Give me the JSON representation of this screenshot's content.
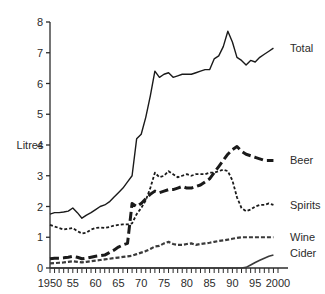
{
  "chart_data": {
    "type": "line",
    "title": "",
    "subtitle": "",
    "xlabel": "",
    "ylabel": "Litres",
    "xlim": [
      1950,
      2000
    ],
    "ylim": [
      0,
      8
    ],
    "ytick_step": 1,
    "xtick_step": 1,
    "xtick_label_step": 5,
    "grid": false,
    "legend_position": "right-inline-labels",
    "yticks": [
      0,
      1,
      2,
      3,
      4,
      5,
      6,
      7,
      8
    ],
    "ytick_labels": [
      "0",
      "1",
      "2",
      "3",
      "4",
      "5",
      "6",
      "7",
      "8"
    ],
    "xticks": [
      1950,
      1955,
      1960,
      1965,
      1970,
      1975,
      1980,
      1985,
      1990,
      1995,
      2000
    ],
    "xtick_labels": [
      "1950",
      "55",
      "60",
      "65",
      "70",
      "75",
      "80",
      "85",
      "90",
      "95",
      "2000"
    ],
    "x": [
      1950,
      1951,
      1952,
      1953,
      1954,
      1955,
      1956,
      1957,
      1958,
      1959,
      1960,
      1961,
      1962,
      1963,
      1964,
      1965,
      1966,
      1967,
      1968,
      1969,
      1970,
      1971,
      1972,
      1973,
      1974,
      1975,
      1976,
      1977,
      1978,
      1979,
      1980,
      1981,
      1982,
      1983,
      1984,
      1985,
      1986,
      1987,
      1988,
      1989,
      1990,
      1991,
      1992,
      1993,
      1994,
      1995,
      1996,
      1997,
      1998,
      1999
    ],
    "series": [
      {
        "name": "Total",
        "label": "Total",
        "style": "solid",
        "color": "#1a1a1a",
        "width": 1.4,
        "values": [
          1.75,
          1.8,
          1.8,
          1.82,
          1.85,
          1.95,
          1.8,
          1.62,
          1.72,
          1.8,
          1.9,
          2.0,
          2.05,
          2.15,
          2.3,
          2.45,
          2.6,
          2.8,
          3.0,
          4.2,
          4.35,
          4.9,
          5.6,
          6.4,
          6.2,
          6.3,
          6.35,
          6.2,
          6.25,
          6.3,
          6.3,
          6.3,
          6.35,
          6.4,
          6.45,
          6.45,
          6.8,
          6.9,
          7.2,
          7.7,
          7.35,
          6.85,
          6.75,
          6.6,
          6.75,
          6.7,
          6.85,
          6.95,
          7.05,
          7.15
        ]
      },
      {
        "name": "Beer",
        "label": "Beer",
        "style": "long-dash",
        "color": "#1a1a1a",
        "width": 3.0,
        "values": [
          0.3,
          0.32,
          0.32,
          0.33,
          0.35,
          0.38,
          0.35,
          0.3,
          0.32,
          0.35,
          0.38,
          0.4,
          0.42,
          0.5,
          0.58,
          0.68,
          0.75,
          0.8,
          2.1,
          2.0,
          2.1,
          2.25,
          2.4,
          2.5,
          2.45,
          2.5,
          2.55,
          2.55,
          2.6,
          2.65,
          2.6,
          2.6,
          2.65,
          2.7,
          2.8,
          2.9,
          3.1,
          3.3,
          3.5,
          3.7,
          3.85,
          3.95,
          3.8,
          3.7,
          3.65,
          3.6,
          3.55,
          3.5,
          3.5,
          3.5
        ]
      },
      {
        "name": "Spirits",
        "label": "Spirits",
        "style": "short-dash",
        "color": "#1a1a1a",
        "width": 1.8,
        "values": [
          1.4,
          1.35,
          1.3,
          1.25,
          1.28,
          1.3,
          1.2,
          1.12,
          1.15,
          1.25,
          1.3,
          1.32,
          1.3,
          1.33,
          1.38,
          1.4,
          1.42,
          1.42,
          1.45,
          1.75,
          1.95,
          2.2,
          2.6,
          3.1,
          2.95,
          3.0,
          3.15,
          3.05,
          2.95,
          3.0,
          3.05,
          3.0,
          3.05,
          3.05,
          3.05,
          3.1,
          3.1,
          3.15,
          3.2,
          3.15,
          2.85,
          2.3,
          1.95,
          1.85,
          1.9,
          2.0,
          2.05,
          2.05,
          2.1,
          2.05
        ]
      },
      {
        "name": "Wine",
        "label": "Wine",
        "style": "thin-double-dash",
        "color": "#3a3a3a",
        "width": 2.2,
        "values": [
          0.15,
          0.16,
          0.17,
          0.18,
          0.2,
          0.22,
          0.2,
          0.18,
          0.2,
          0.22,
          0.24,
          0.26,
          0.28,
          0.3,
          0.32,
          0.34,
          0.36,
          0.38,
          0.4,
          0.45,
          0.5,
          0.55,
          0.62,
          0.7,
          0.72,
          0.8,
          0.85,
          0.78,
          0.75,
          0.75,
          0.78,
          0.8,
          0.75,
          0.78,
          0.8,
          0.82,
          0.85,
          0.88,
          0.9,
          0.92,
          0.95,
          0.98,
          1.0,
          1.0,
          1.0,
          1.0,
          1.0,
          1.0,
          1.0,
          1.0
        ]
      },
      {
        "name": "Cider",
        "label": "Cider",
        "style": "solid",
        "color": "#3a3a3a",
        "width": 1.6,
        "values": [
          0.0,
          0.0,
          0.0,
          0.0,
          0.0,
          0.0,
          0.0,
          0.0,
          0.0,
          0.0,
          0.0,
          0.0,
          0.0,
          0.0,
          0.0,
          0.0,
          0.0,
          0.0,
          0.0,
          0.0,
          0.0,
          0.0,
          0.0,
          0.0,
          0.0,
          0.0,
          0.0,
          0.0,
          0.0,
          0.0,
          0.0,
          0.0,
          0.0,
          0.0,
          0.0,
          0.0,
          0.0,
          0.0,
          0.0,
          0.0,
          0.0,
          0.0,
          0.0,
          0.02,
          0.1,
          0.18,
          0.25,
          0.32,
          0.38,
          0.42
        ]
      }
    ]
  }
}
